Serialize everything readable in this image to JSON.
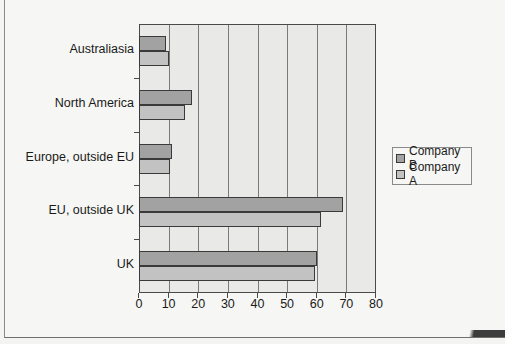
{
  "chart_data": {
    "type": "bar",
    "orientation": "horizontal",
    "title": "",
    "xlabel": "",
    "ylabel": "",
    "categories": [
      "Australiasia",
      "North America",
      "Europe, outside EU",
      "EU, outside UK",
      "UK"
    ],
    "series": [
      {
        "name": "Company B",
        "color": "#a2a2a2",
        "values": [
          9,
          18,
          11,
          69,
          60
        ]
      },
      {
        "name": "Company A",
        "color": "#c2c2c2",
        "values": [
          10,
          15.5,
          10.5,
          61.5,
          59.5
        ]
      }
    ],
    "xlim": [
      0,
      80
    ],
    "x_ticks": [
      0,
      10,
      20,
      30,
      40,
      50,
      60,
      70,
      80
    ],
    "grid": "vertical major gridlines",
    "legend_position": "right"
  },
  "axis": {
    "x_tick_labels": [
      "0",
      "10",
      "20",
      "30",
      "40",
      "50",
      "60",
      "70",
      "80"
    ]
  },
  "legend": {
    "items": [
      {
        "label": "Company B",
        "color": "#a2a2a2"
      },
      {
        "label": "Company A",
        "color": "#c2c2c2"
      }
    ]
  },
  "colors": {
    "plot_background": "#e9e9e7",
    "gridline": "#7a7a7a",
    "bar_outline": "#3a3a3a"
  }
}
